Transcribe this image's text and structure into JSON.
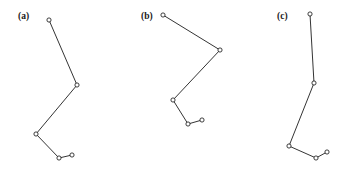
{
  "figure": {
    "background_color": "#ffffff",
    "width": 354,
    "height": 174,
    "stroke_color": "#1d1d1d",
    "node_fill_color": "#ffffff",
    "label_color": "#1a1a1a"
  },
  "chart_data": {
    "type": "line",
    "title": "",
    "xlabel": "",
    "ylabel": "",
    "grid": false,
    "legend": "none",
    "axes_visible": false,
    "marker": "open-circle",
    "xlim": [
      0,
      354
    ],
    "ylim": [
      174,
      0
    ],
    "panels": [
      {
        "label": "(a)",
        "label_x": 18,
        "label_y": 19,
        "node_count": 5,
        "segment_count": 4,
        "x": [
          49,
          77,
          36,
          59,
          72
        ],
        "y": [
          20,
          85,
          134,
          158,
          155
        ]
      },
      {
        "label": "(b)",
        "label_x": 141,
        "label_y": 19,
        "node_count": 5,
        "segment_count": 4,
        "x": [
          163,
          220,
          173,
          188,
          202
        ],
        "y": [
          15,
          50,
          100,
          124,
          120
        ]
      },
      {
        "label": "(c)",
        "label_x": 277,
        "label_y": 19,
        "node_count": 5,
        "segment_count": 4,
        "x": [
          310,
          314,
          289,
          316,
          327
        ],
        "y": [
          14,
          83,
          146,
          158,
          152
        ]
      }
    ]
  }
}
